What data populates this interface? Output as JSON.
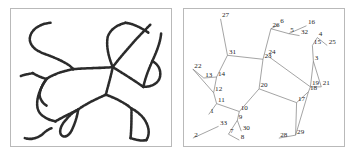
{
  "figure": {
    "title": "",
    "panels": [
      {
        "id": "raster-map",
        "name": "hand-drawn-road-network",
        "caption": "",
        "stroke_color": "#2b2b2b",
        "border_color": "#b9b9b9",
        "background": "#ffffff"
      },
      {
        "id": "graph-map",
        "name": "numbered-node-graph",
        "caption": "",
        "edge_color": "#7a7a7a",
        "label_color": "#1d1d1d",
        "border_color": "#b9b9b9",
        "background": "#ffffff"
      }
    ]
  },
  "chart_data": {
    "type": "scatter",
    "title": "",
    "subtitle": "",
    "xlabel": "",
    "ylabel": "",
    "xlim": [
      0,
      162
    ],
    "ylim": [
      0,
      139
    ],
    "grid": false,
    "legend": null,
    "annotations": [],
    "node_count": 33,
    "nodes": [
      {
        "id": "1",
        "label": "1",
        "x": 25,
        "y": 107
      },
      {
        "id": "2",
        "label": "2",
        "x": 9,
        "y": 131
      },
      {
        "id": "3",
        "label": "3",
        "x": 131,
        "y": 53
      },
      {
        "id": "4",
        "label": "4",
        "x": 135,
        "y": 29
      },
      {
        "id": "5",
        "label": "5",
        "x": 106,
        "y": 25
      },
      {
        "id": "6",
        "label": "6",
        "x": 96,
        "y": 16
      },
      {
        "id": "7",
        "label": "7",
        "x": 45,
        "y": 127
      },
      {
        "id": "8",
        "label": "8",
        "x": 56,
        "y": 133
      },
      {
        "id": "9",
        "label": "9",
        "x": 54,
        "y": 113
      },
      {
        "id": "10",
        "label": "10",
        "x": 56,
        "y": 104
      },
      {
        "id": "11",
        "label": "11",
        "x": 33,
        "y": 96
      },
      {
        "id": "12",
        "label": "12",
        "x": 30,
        "y": 85
      },
      {
        "id": "13",
        "label": "13",
        "x": 20,
        "y": 70
      },
      {
        "id": "14",
        "label": "14",
        "x": 33,
        "y": 69
      },
      {
        "id": "15",
        "label": "15",
        "x": 130,
        "y": 37
      },
      {
        "id": "16",
        "label": "16",
        "x": 124,
        "y": 17
      },
      {
        "id": "17",
        "label": "17",
        "x": 114,
        "y": 95
      },
      {
        "id": "18",
        "label": "18",
        "x": 126,
        "y": 84
      },
      {
        "id": "19",
        "label": "19",
        "x": 128,
        "y": 79
      },
      {
        "id": "20",
        "label": "20",
        "x": 76,
        "y": 81
      },
      {
        "id": "21",
        "label": "21",
        "x": 139,
        "y": 79
      },
      {
        "id": "22",
        "label": "22",
        "x": 9,
        "y": 61
      },
      {
        "id": "23",
        "label": "23",
        "x": 80,
        "y": 51
      },
      {
        "id": "24",
        "label": "24",
        "x": 84,
        "y": 47
      },
      {
        "id": "25",
        "label": "25",
        "x": 145,
        "y": 37
      },
      {
        "id": "26",
        "label": "26",
        "x": 88,
        "y": 20
      },
      {
        "id": "27",
        "label": "27",
        "x": 37,
        "y": 10
      },
      {
        "id": "28",
        "label": "28",
        "x": 96,
        "y": 131
      },
      {
        "id": "29",
        "label": "29",
        "x": 113,
        "y": 128
      },
      {
        "id": "30",
        "label": "30",
        "x": 58,
        "y": 124
      },
      {
        "id": "31",
        "label": "31",
        "x": 44,
        "y": 47
      },
      {
        "id": "32",
        "label": "32",
        "x": 117,
        "y": 27
      },
      {
        "id": "33",
        "label": "33",
        "x": 35,
        "y": 119
      }
    ],
    "edges": [
      [
        "27",
        "31"
      ],
      [
        "31",
        "23"
      ],
      [
        "31",
        "14"
      ],
      [
        "14",
        "13"
      ],
      [
        "13",
        "22"
      ],
      [
        "22",
        "12"
      ],
      [
        "14",
        "12"
      ],
      [
        "12",
        "11"
      ],
      [
        "11",
        "1"
      ],
      [
        "11",
        "10"
      ],
      [
        "10",
        "20"
      ],
      [
        "10",
        "9"
      ],
      [
        "9",
        "7"
      ],
      [
        "9",
        "30"
      ],
      [
        "7",
        "8"
      ],
      [
        "2",
        "33"
      ],
      [
        "20",
        "23"
      ],
      [
        "20",
        "17"
      ],
      [
        "23",
        "26"
      ],
      [
        "26",
        "6"
      ],
      [
        "26",
        "5"
      ],
      [
        "5",
        "16"
      ],
      [
        "5",
        "32"
      ],
      [
        "24",
        "19"
      ],
      [
        "15",
        "4"
      ],
      [
        "4",
        "25"
      ],
      [
        "15",
        "3"
      ],
      [
        "3",
        "21"
      ],
      [
        "3",
        "19"
      ],
      [
        "19",
        "21"
      ],
      [
        "19",
        "18"
      ],
      [
        "18",
        "17"
      ],
      [
        "17",
        "29"
      ],
      [
        "18",
        "29"
      ],
      [
        "28",
        "29"
      ]
    ]
  }
}
